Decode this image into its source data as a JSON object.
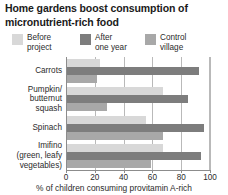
{
  "title": "Home gardens boost consumption of micronutrient-rich food",
  "legend": {
    "position": "top-left",
    "items": [
      {
        "label": "Before\nproject",
        "color": "#d8d8d8",
        "name": "before-project"
      },
      {
        "label": "After\none year",
        "color": "#7d7d7d",
        "name": "after-one-year"
      },
      {
        "label": "Control\nvillage",
        "color": "#a8a8a8",
        "name": "control-village"
      }
    ]
  },
  "chart_data": {
    "type": "bar",
    "orientation": "horizontal",
    "title": "Home gardens boost consumption of micronutrient-rich food",
    "subtitle": "",
    "xlabel": "% of children consuming provitamin A-rich",
    "ylabel": "",
    "xlim": [
      0,
      100
    ],
    "ylim": null,
    "grid": true,
    "gridlines": [
      20,
      40,
      60,
      80,
      100
    ],
    "legend_position": "top-left",
    "categories": [
      "Carrots",
      "Pumpkin/\nbutternut\nsquash",
      "Spinach",
      "Imifino\n(green, leafy\nvegetables)"
    ],
    "xticks": [
      0,
      20,
      40,
      60,
      80,
      100
    ],
    "xticklabels": [
      "0",
      "20",
      "40",
      "60",
      "80",
      "100"
    ],
    "series": [
      {
        "name": "Before project",
        "color": "#d8d8d8",
        "values": [
          23,
          67,
          55,
          67
        ]
      },
      {
        "name": "After one year",
        "color": "#7d7d7d",
        "values": [
          92,
          84,
          95,
          93
        ]
      },
      {
        "name": "Control village",
        "color": "#a8a8a8",
        "values": [
          21,
          28,
          67,
          58
        ]
      }
    ]
  },
  "axis": {
    "x_title": "% of children consuming provitamin A-rich"
  }
}
